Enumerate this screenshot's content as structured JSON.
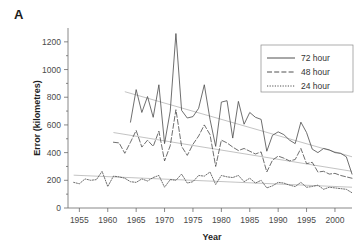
{
  "panel": {
    "label": "A"
  },
  "chart_data": {
    "type": "line",
    "title": "",
    "xlabel": "Year",
    "ylabel": "Error (kilometres)",
    "xlim": [
      1953,
      2003
    ],
    "ylim": [
      0,
      1300
    ],
    "xticks": [
      1955,
      1960,
      1965,
      1970,
      1975,
      1980,
      1985,
      1990,
      1995,
      2000
    ],
    "yticks": [
      0,
      200,
      400,
      600,
      800,
      1000,
      1200
    ],
    "xtick_labels": [
      "1955",
      "1960",
      "1965",
      "1970",
      "1975",
      "1980",
      "1985",
      "1990",
      "1995",
      "2000"
    ],
    "ytick_labels": [
      "0",
      "200",
      "400",
      "600",
      "800",
      "1000",
      "1200"
    ],
    "grid": false,
    "legend_position": "top-right",
    "legend": [
      "72 hour",
      "48 hour",
      "24 hour"
    ],
    "series": [
      {
        "name": "72 hour",
        "style": "solid",
        "x": [
          1964,
          1965,
          1966,
          1967,
          1968,
          1969,
          1970,
          1971,
          1972,
          1973,
          1974,
          1975,
          1976,
          1977,
          1978,
          1979,
          1980,
          1981,
          1982,
          1983,
          1984,
          1985,
          1986,
          1987,
          1988,
          1989,
          1990,
          1991,
          1992,
          1993,
          1994,
          1995,
          1996,
          1997,
          1998,
          1999,
          2000,
          2001,
          2002,
          2003
        ],
        "values": [
          620,
          855,
          690,
          805,
          655,
          890,
          465,
          700,
          1260,
          705,
          650,
          660,
          720,
          890,
          640,
          445,
          765,
          775,
          505,
          770,
          605,
          690,
          655,
          640,
          410,
          525,
          550,
          530,
          490,
          465,
          620,
          545,
          425,
          400,
          430,
          420,
          400,
          395,
          370,
          245
        ]
      },
      {
        "name": "48 hour",
        "style": "dashed",
        "x": [
          1961,
          1962,
          1963,
          1964,
          1965,
          1966,
          1967,
          1968,
          1969,
          1970,
          1971,
          1972,
          1973,
          1974,
          1975,
          1976,
          1977,
          1978,
          1979,
          1980,
          1981,
          1982,
          1983,
          1984,
          1985,
          1986,
          1987,
          1988,
          1989,
          1990,
          1991,
          1992,
          1993,
          1994,
          1995,
          1996,
          1997,
          1998,
          1999,
          2000,
          2001,
          2002,
          2003
        ],
        "values": [
          475,
          470,
          395,
          475,
          560,
          440,
          490,
          445,
          555,
          340,
          450,
          710,
          445,
          380,
          460,
          520,
          600,
          530,
          300,
          490,
          470,
          440,
          415,
          430,
          410,
          390,
          405,
          260,
          345,
          375,
          360,
          340,
          350,
          430,
          320,
          330,
          260,
          265,
          245,
          250,
          235,
          225,
          215
        ]
      },
      {
        "name": "24 hour",
        "style": "dotted",
        "x": [
          1954,
          1955,
          1956,
          1957,
          1958,
          1959,
          1960,
          1961,
          1962,
          1963,
          1964,
          1965,
          1966,
          1967,
          1968,
          1969,
          1970,
          1971,
          1972,
          1973,
          1974,
          1975,
          1976,
          1977,
          1978,
          1979,
          1980,
          1981,
          1982,
          1983,
          1984,
          1985,
          1986,
          1987,
          1988,
          1989,
          1990,
          1991,
          1992,
          1993,
          1994,
          1995,
          1996,
          1997,
          1998,
          1999,
          2000,
          2001,
          2002,
          2003
        ],
        "values": [
          185,
          175,
          210,
          200,
          205,
          265,
          155,
          230,
          225,
          215,
          190,
          185,
          210,
          195,
          220,
          235,
          150,
          205,
          200,
          245,
          180,
          190,
          235,
          230,
          260,
          170,
          235,
          225,
          220,
          235,
          190,
          215,
          180,
          200,
          145,
          160,
          185,
          180,
          165,
          155,
          185,
          150,
          155,
          165,
          135,
          150,
          145,
          140,
          135,
          110
        ]
      }
    ],
    "trend_lines": [
      {
        "name": "72 hour trend",
        "x": [
          1963,
          2003
        ],
        "values": [
          840,
          370
        ]
      },
      {
        "name": "48 hour trend",
        "x": [
          1961,
          2003
        ],
        "values": [
          545,
          265
        ]
      },
      {
        "name": "24 hour trend",
        "x": [
          1954,
          2003
        ],
        "values": [
          237,
          150
        ]
      }
    ]
  }
}
